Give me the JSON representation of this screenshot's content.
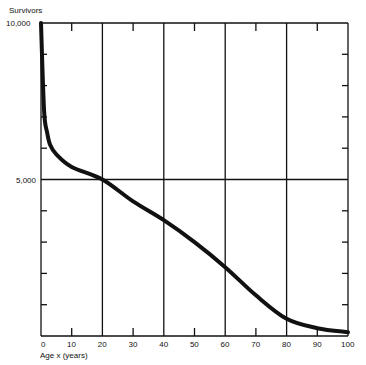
{
  "chart_data": {
    "type": "line",
    "title": "",
    "xlabel": "Age x (years)",
    "ylabel": "Survivors",
    "xlim": [
      0,
      100
    ],
    "ylim": [
      0,
      10000
    ],
    "x_ticks": [
      "0",
      "10",
      "20",
      "30",
      "40",
      "50",
      "60",
      "70",
      "80",
      "90",
      "100"
    ],
    "y_tick_labels": [
      "5,000",
      "10,000"
    ],
    "grid": "vertical lines at 20, 40, 60, 80; horizontal line at 5,000",
    "series": [
      {
        "name": "Survivors",
        "x": [
          0,
          1,
          2,
          3,
          5,
          10,
          20,
          30,
          40,
          50,
          60,
          70,
          80,
          90,
          100
        ],
        "values": [
          10000,
          7200,
          6500,
          6100,
          5800,
          5400,
          5000,
          4300,
          3700,
          3000,
          2200,
          1300,
          550,
          250,
          120
        ]
      }
    ]
  },
  "labels": {
    "ylabel": "Survivors",
    "y_top": "10,000",
    "y_mid": "5,000",
    "xlabel": "Age x (years)",
    "xticks": [
      "0",
      "10",
      "20",
      "30",
      "40",
      "50",
      "60",
      "70",
      "80",
      "90",
      "100"
    ]
  }
}
